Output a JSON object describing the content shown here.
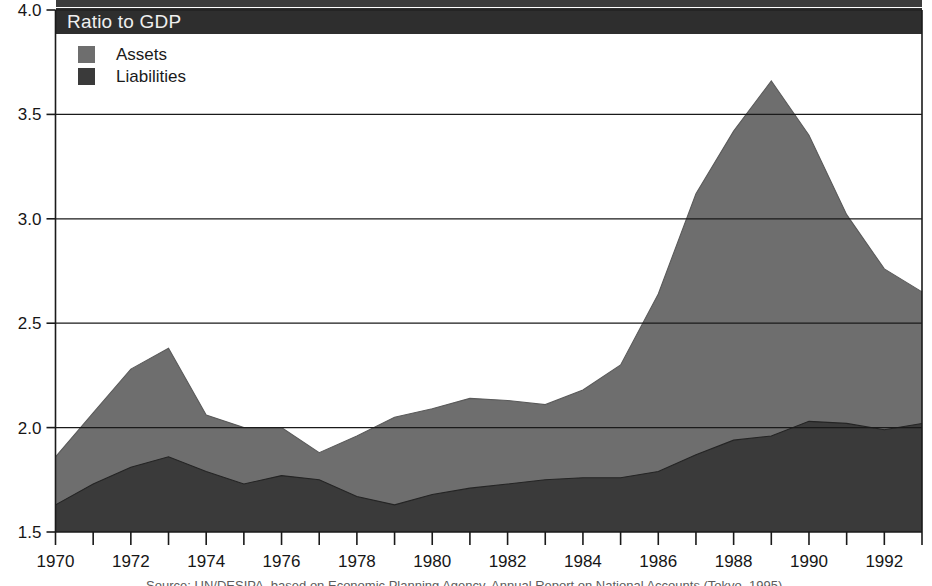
{
  "banner": {
    "title": "Ratio to GDP"
  },
  "legend": {
    "position": "top-left-inside",
    "items": [
      {
        "label": "Assets",
        "color": "#6e6e6e",
        "swatch_name": "assets-swatch"
      },
      {
        "label": "Liabilities",
        "color": "#3a3a3a",
        "swatch_name": "liabilities-swatch"
      }
    ]
  },
  "source": {
    "text": "Source:  UN/DESIPA, based on Economic Planning Agency, Annual Report on National Accounts (Tokyo, 1995)."
  },
  "axes": {
    "y_tick_labels": [
      "4.0",
      "3.5",
      "3.0",
      "2.5",
      "2.0",
      "1.5"
    ],
    "x_tick_labels": [
      "1970",
      "1972",
      "1974",
      "1976",
      "1978",
      "1980",
      "1982",
      "1984",
      "1986",
      "1988",
      "1990",
      "1992"
    ]
  },
  "chart_data": {
    "type": "area",
    "stacked": false,
    "title": "Ratio to GDP",
    "xlabel": "",
    "ylabel": "Ratio to GDP",
    "xlim": [
      1970,
      1993
    ],
    "ylim": [
      1.5,
      4.0
    ],
    "y_ticks": [
      1.5,
      2.0,
      2.5,
      3.0,
      3.5,
      4.0
    ],
    "x_ticks": [
      1970,
      1971,
      1972,
      1973,
      1974,
      1975,
      1976,
      1977,
      1978,
      1979,
      1980,
      1981,
      1982,
      1983,
      1984,
      1985,
      1986,
      1987,
      1988,
      1989,
      1990,
      1991,
      1992,
      1993
    ],
    "x_tick_labels_shown": [
      1970,
      1972,
      1974,
      1976,
      1978,
      1980,
      1982,
      1984,
      1986,
      1988,
      1990,
      1992
    ],
    "grid": "horizontal",
    "legend_position": "upper left",
    "x": [
      1970,
      1971,
      1972,
      1973,
      1974,
      1975,
      1976,
      1977,
      1978,
      1979,
      1980,
      1981,
      1982,
      1983,
      1984,
      1985,
      1986,
      1987,
      1988,
      1989,
      1990,
      1991,
      1992,
      1993
    ],
    "series": [
      {
        "name": "Assets",
        "color": "#6e6e6e",
        "values": [
          1.86,
          2.07,
          2.28,
          2.38,
          2.06,
          2.0,
          2.0,
          1.88,
          1.96,
          2.05,
          2.09,
          2.14,
          2.13,
          2.11,
          2.18,
          2.3,
          2.64,
          3.12,
          3.42,
          3.66,
          3.4,
          3.02,
          2.76,
          2.65
        ]
      },
      {
        "name": "Liabilities",
        "color": "#3a3a3a",
        "values": [
          1.63,
          1.73,
          1.81,
          1.86,
          1.79,
          1.73,
          1.77,
          1.75,
          1.67,
          1.63,
          1.68,
          1.71,
          1.73,
          1.75,
          1.76,
          1.76,
          1.79,
          1.87,
          1.94,
          1.96,
          2.03,
          2.02,
          1.99,
          2.02
        ]
      }
    ]
  },
  "style": {
    "banner_bg": "#2e2e2e",
    "banner_fg": "#efefef",
    "axis_color": "#1a1a1a",
    "grid_color": "#1a1a1a",
    "plot_bg": "#ffffff"
  }
}
